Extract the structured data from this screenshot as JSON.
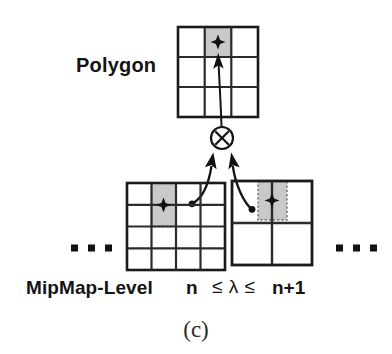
{
  "figure": {
    "caption": "(c)",
    "polygon_label": "Polygon",
    "mipmap_label": "MipMap-Level",
    "level_lower": "n",
    "lambda_expr": "≤ λ ≤",
    "level_upper": "n+1",
    "operator_symbol": "⊗",
    "ellipsis_left": "▪ ▪ ▪",
    "ellipsis_right": "▪ ▪ ▪",
    "sample_marker": "✦"
  },
  "colors": {
    "stroke": "#1a1a1a",
    "grid_line": "#333333",
    "shade_fill": "#c9c9c9",
    "shade_dash": "#6e6e6e",
    "background": "#ffffff",
    "text": "#141414"
  },
  "grids": {
    "polygon": {
      "name": "polygon-grid",
      "rows": 3,
      "cols": 3,
      "x": 178,
      "y": 27,
      "width": 80,
      "height": 90,
      "highlight": {
        "row": 0,
        "col": 1,
        "row_span": 1,
        "col_span": 1
      },
      "marker": {
        "x": 218,
        "y": 42
      }
    },
    "level_n": {
      "name": "mipmap-level-n-grid",
      "rows": 4,
      "cols": 4,
      "x": 127,
      "y": 183,
      "width": 98,
      "height": 87,
      "highlight": {
        "row": 0,
        "col": 1,
        "row_span": 2,
        "col_span": 1
      },
      "marker": {
        "x": 163,
        "y": 205
      }
    },
    "level_n_plus_1": {
      "name": "mipmap-level-n-plus-1-grid",
      "rows": 2,
      "cols": 2,
      "x": 232,
      "y": 181,
      "width": 80,
      "height": 84,
      "highlight": {
        "row": 0,
        "col": 1,
        "row_span": 1,
        "col_span": 1
      },
      "marker": {
        "x": 272,
        "y": 200
      }
    }
  },
  "operator": {
    "cx": 222,
    "cy": 138,
    "r": 11
  },
  "arrows": {
    "to_polygon": {
      "from_x": 222,
      "from_y": 126,
      "to_x": 218,
      "to_y": 55
    },
    "from_level_n": {
      "from_x": 190,
      "from_y": 202,
      "to_x": 213,
      "to_y": 152
    },
    "from_level_n_plus_1": {
      "from_x": 253,
      "from_y": 208,
      "to_x": 231,
      "to_y": 152
    }
  }
}
